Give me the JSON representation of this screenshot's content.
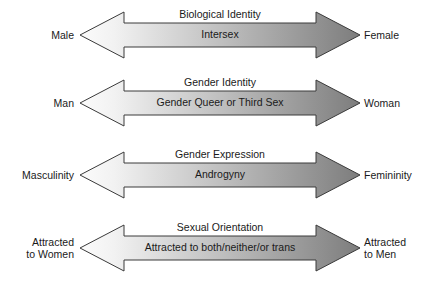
{
  "diagram": {
    "colors": {
      "gradient_start": "#fbfbfb",
      "gradient_end": "#7d7d7d",
      "arrowhead_left": "#fcfcfc",
      "arrowhead_right": "#7a7a7a",
      "outline": "#3a3a3a",
      "text": "#1a1a1a",
      "background": "#ffffff"
    },
    "rows": [
      {
        "id": "biological-identity",
        "left_label": "Male",
        "right_label": "Female",
        "title": "Biological Identity",
        "middle": "Intersex"
      },
      {
        "id": "gender-identity",
        "left_label": "Man",
        "right_label": "Woman",
        "title": "Gender Identity",
        "middle": "Gender Queer or Third Sex"
      },
      {
        "id": "gender-expression",
        "left_label": "Masculinity",
        "right_label": "Femininity",
        "title": "Gender Expression",
        "middle": "Androgyny"
      },
      {
        "id": "sexual-orientation",
        "left_label": "Attracted\nto Women",
        "right_label": "Attracted\nto Men",
        "title": "Sexual Orientation",
        "middle": "Attracted to both/neither/or trans"
      }
    ]
  }
}
